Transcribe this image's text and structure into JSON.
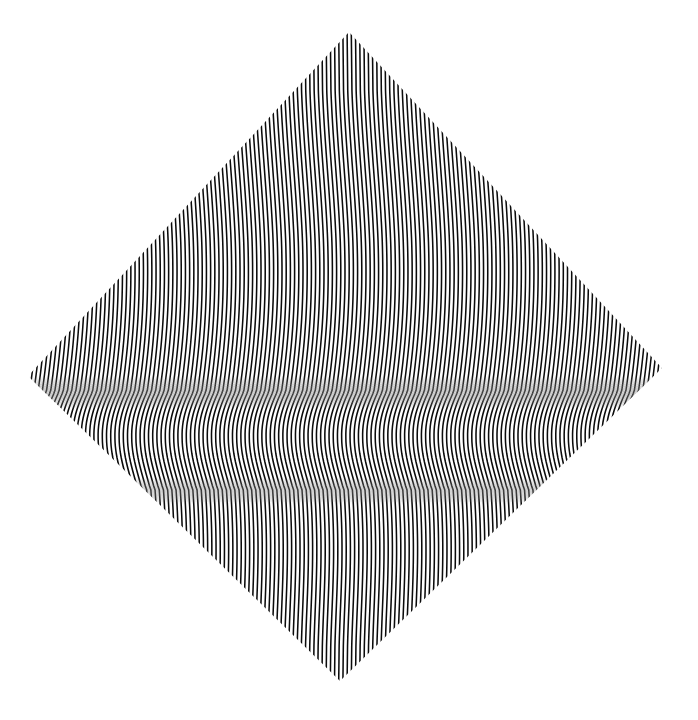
{
  "canvas": {
    "width": 698,
    "height": 720,
    "background_color": "#ffffff",
    "ink_color": "#0b0b0b"
  },
  "artwork": {
    "title": "Untitled Op Art Diamond",
    "medium_description": "Black and white undulating line field within a rotated square",
    "style": "op-art",
    "shape": "diamond",
    "line_color": "#0b0b0b",
    "field_color": "#ffffff",
    "line_count": 152,
    "line_orientation": "vertical",
    "stroke_width_px": 1.55
  },
  "diamond": {
    "top_vertex": {
      "x": 349,
      "y": 32
    },
    "right_vertex": {
      "x": 662,
      "y": 368
    },
    "bottom_vertex": {
      "x": 340,
      "y": 681
    },
    "left_vertex": {
      "x": 28,
      "y": 376
    },
    "width_px": 634,
    "height_px": 649
  },
  "wave_field": {
    "description": "Sinusoidal horizontal displacement of vertical lines varying with vertical position",
    "bands": [
      {
        "name": "upper-straight",
        "y_start": 32,
        "y_end": 150,
        "amplitude_px": 0.5,
        "character": "near straight vertical"
      },
      {
        "name": "upper-swell",
        "y_start": 150,
        "y_end": 330,
        "amplitude_px": 9.0,
        "character": "broad rightward bulge"
      },
      {
        "name": "upper-compression",
        "y_start": 330,
        "y_end": 392,
        "amplitude_px": 15.0,
        "character": "tight curvature, grey moire"
      },
      {
        "name": "central-grey-band",
        "y_start": 383,
        "y_end": 404,
        "amplitude_px": 17.0,
        "character": "maximum compression, solid grey"
      },
      {
        "name": "lower-release",
        "y_start": 404,
        "y_end": 470,
        "amplitude_px": 13.0,
        "character": "reverse curvature"
      },
      {
        "name": "lower-compression",
        "y_start": 470,
        "y_end": 512,
        "amplitude_px": 10.0,
        "character": "second grey moire band"
      },
      {
        "name": "lower-swell",
        "y_start": 512,
        "y_end": 610,
        "amplitude_px": 6.0,
        "character": "gentle leftward bulge"
      },
      {
        "name": "lower-straight",
        "y_start": 610,
        "y_end": 681,
        "amplitude_px": 0.8,
        "character": "near straight vertical"
      }
    ],
    "grey_band_centers_y": [
      392,
      490
    ],
    "grey_band_color": "#8f8f8f"
  },
  "top_fragment": {
    "text": "",
    "color": "#b9b9bd",
    "note": "clipped glyph tails at top edge"
  }
}
